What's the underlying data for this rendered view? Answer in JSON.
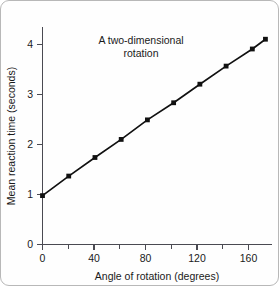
{
  "figure": {
    "background_color": "#fefefe",
    "border_color": "#b8b8b8",
    "line_color": "#111111",
    "axis_color": "#4a4a52"
  },
  "annotation": {
    "line1": "A two-dimensional",
    "line2": "rotation"
  },
  "axis": {
    "x_title": "Angle of rotation (degrees)",
    "y_title": "Mean reaction time (seconds)",
    "x_tick_labels": [
      "0",
      "40",
      "80",
      "120",
      "160"
    ],
    "y_tick_labels": [
      "0",
      "1",
      "2",
      "3",
      "4"
    ]
  },
  "chart_data": {
    "type": "line",
    "title": "A two-dimensional rotation",
    "xlabel": "Angle of rotation (degrees)",
    "ylabel": "Mean reaction time (seconds)",
    "xlim": [
      0,
      175
    ],
    "ylim": [
      0,
      4.45
    ],
    "xticks": [
      0,
      40,
      80,
      120,
      160
    ],
    "xticks_minor": [
      20,
      60,
      100,
      140
    ],
    "yticks": [
      0,
      1,
      2,
      3,
      4
    ],
    "grid": false,
    "legend": false,
    "marker": "square",
    "x": [
      0,
      20,
      40,
      60,
      80,
      100,
      120,
      140,
      160,
      170
    ],
    "values": [
      1.0,
      1.4,
      1.78,
      2.15,
      2.55,
      2.9,
      3.28,
      3.65,
      4.0,
      4.2
    ],
    "series": [
      {
        "name": "Mean reaction time",
        "values": [
          1.0,
          1.4,
          1.78,
          2.15,
          2.55,
          2.9,
          3.28,
          3.65,
          4.0,
          4.2
        ]
      }
    ],
    "annotations": [
      {
        "text": "A two-dimensional rotation",
        "x": 65,
        "y": 4.15
      }
    ]
  }
}
